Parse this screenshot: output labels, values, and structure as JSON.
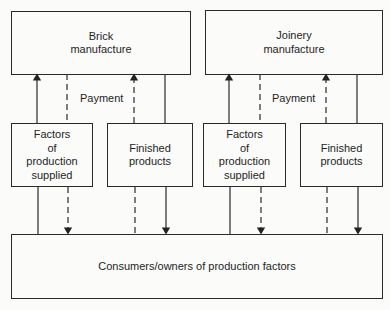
{
  "diagram": {
    "top_boxes": [
      {
        "id": "brick",
        "lines": [
          "Brick",
          "manufacture"
        ]
      },
      {
        "id": "joinery",
        "lines": [
          "Joinery",
          "manufacture"
        ]
      }
    ],
    "middle_boxes": [
      {
        "id": "factors-1",
        "lines": [
          "Factors",
          "of",
          "production",
          "supplied"
        ]
      },
      {
        "id": "finished-1",
        "lines": [
          "Finished",
          "products"
        ]
      },
      {
        "id": "factors-2",
        "lines": [
          "Factors",
          "of",
          "production",
          "supplied"
        ]
      },
      {
        "id": "finished-2",
        "lines": [
          "Finished",
          "products"
        ]
      }
    ],
    "payment_labels": [
      "Payment",
      "Payment"
    ],
    "bottom_box": {
      "label": "Consumers/owners of production factors"
    },
    "legend": {
      "solid_line": "flow of goods/factors",
      "dashed_line": "flow of payment"
    }
  }
}
